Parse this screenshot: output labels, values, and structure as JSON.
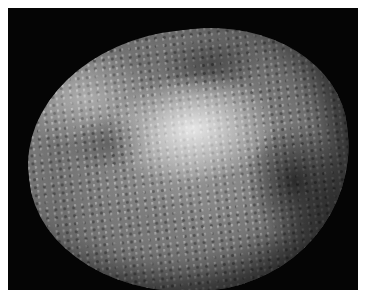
{
  "image": {
    "subject": "grayscale photograph of a rounded stone with mottled light and dark patches",
    "background_color": "#050505",
    "border_color": "#ffffff",
    "palette": [
      "#ebebeb",
      "#9a9a9a",
      "#6a6a6a",
      "#3a3a3a",
      "#050505"
    ]
  }
}
